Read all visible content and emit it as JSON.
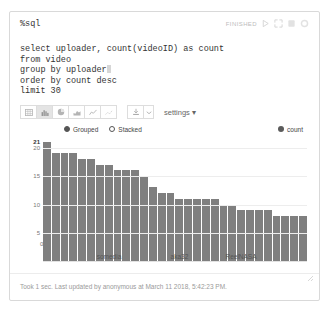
{
  "notebook": {
    "magic": "%sql",
    "status_text": "FINISHED",
    "code_lines": [
      "select uploader, count(videoID) as count",
      "from video",
      "group by uploader",
      "order by count desc",
      "limit 30"
    ],
    "header_icons": [
      {
        "name": "run-icon",
        "glyph": "play"
      },
      {
        "name": "expand-icon",
        "glyph": "expand"
      },
      {
        "name": "book-icon",
        "glyph": "book"
      },
      {
        "name": "gear-icon",
        "glyph": "gear"
      }
    ],
    "footer_text": "Took 1 sec. Last updated by anonymous at March 11 2018, 5:42:23 PM."
  },
  "toolbar": {
    "buttons": [
      {
        "name": "table-view-button",
        "icon": "table-icon",
        "active": false
      },
      {
        "name": "bar-chart-button",
        "icon": "bar-chart-icon",
        "active": true
      },
      {
        "name": "pie-chart-button",
        "icon": "pie-chart-icon",
        "active": false
      },
      {
        "name": "area-chart-button",
        "icon": "area-chart-icon",
        "active": false
      },
      {
        "name": "line-chart-button",
        "icon": "line-chart-icon",
        "active": false
      },
      {
        "name": "scatter-chart-button",
        "icon": "scatter-chart-icon",
        "active": false
      }
    ],
    "download_label": "",
    "settings_label": "settings"
  },
  "chart_controls": {
    "mode_options": [
      {
        "label": "Grouped",
        "selected": true
      },
      {
        "label": "Stacked",
        "selected": false
      }
    ],
    "series_legend": "count",
    "series_color": "#7f7f7f"
  },
  "chart_data": {
    "type": "bar",
    "title": "",
    "xlabel": "",
    "ylabel": "",
    "ylim": [
      0,
      21.6
    ],
    "yticks": [
      5,
      10,
      15,
      20
    ],
    "peak_label": "21",
    "grid": true,
    "legend_position": "top",
    "categories": [
      "",
      "",
      "",
      "",
      "",
      "somedia",
      "",
      "",
      "",
      "",
      "",
      "",
      "",
      "",
      "",
      "aka32",
      "",
      "",
      "",
      "",
      "",
      "",
      "",
      "ReelNASA",
      "",
      "",
      "",
      "",
      "",
      ""
    ],
    "x_visible_labels": [
      {
        "label": "somedia",
        "index": 7
      },
      {
        "label": "aka32",
        "index": 15
      },
      {
        "label": "ReelNASA",
        "index": 22
      }
    ],
    "series": [
      {
        "name": "count",
        "values": [
          21,
          19,
          19,
          19,
          18,
          18,
          17,
          17,
          16,
          16,
          16,
          15,
          13,
          12,
          12,
          11,
          11,
          11,
          11,
          11,
          10,
          10,
          9,
          9,
          9,
          9,
          8,
          8,
          8,
          8
        ]
      }
    ]
  }
}
